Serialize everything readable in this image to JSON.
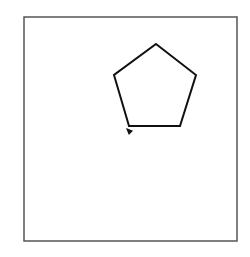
{
  "canvas": {
    "width": 250,
    "height": 257,
    "background": "#ffffff",
    "frame": {
      "x": 24,
      "y": 17,
      "width": 213,
      "height": 224,
      "stroke": "#555555",
      "stroke_width": 1.5
    }
  },
  "shape": {
    "type": "pentagon",
    "stroke": "#111111",
    "stroke_width": 2,
    "points": [
      [
        156,
        44
      ],
      [
        196,
        75
      ],
      [
        180,
        126
      ],
      [
        129,
        126
      ],
      [
        114,
        75
      ]
    ]
  },
  "turtle": {
    "type": "arrow-cursor",
    "x": 126,
    "y": 128,
    "heading_deg": 225,
    "color": "#111111"
  }
}
